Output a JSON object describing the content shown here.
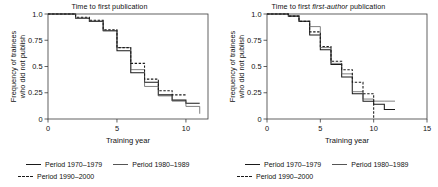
{
  "figure": {
    "background": "#ffffff",
    "width": 438,
    "height": 187
  },
  "panels": [
    {
      "id": "left",
      "title": "Time to first publication",
      "title_italic_part": "",
      "xlabel": "Training year",
      "ylabel_line1": "Frequency of trainees",
      "ylabel_line2": "who did not publish",
      "xticks": [
        "0",
        "5",
        "10"
      ],
      "yticks": [
        "1.0",
        "0.75",
        "0.5",
        "0.25",
        "0"
      ]
    },
    {
      "id": "right",
      "title_prefix": "Time to first ",
      "title_italic_part": "first-author",
      "title_suffix": " publication",
      "xlabel": "Training year",
      "ylabel_line1": "Frequency of trainees",
      "ylabel_line2": "who did not publish",
      "xticks": [
        "0",
        "5",
        "10",
        "15"
      ],
      "yticks": [
        "1.0",
        "0.75",
        "0.5",
        "0.25",
        "0"
      ]
    }
  ],
  "legend": {
    "entries": [
      {
        "label": "Period 1970–1979",
        "style": "solid-thick",
        "color": "#1a1a1a"
      },
      {
        "label": "Period 1980–1989",
        "style": "solid-thin",
        "color": "#555555"
      },
      {
        "label": "Period 1990–2000",
        "style": "dashed",
        "color": "#1a1a1a"
      }
    ]
  },
  "chart_data": [
    {
      "type": "line",
      "subtype": "kaplan-meier-step",
      "panel": "left",
      "title": "Time to first publication",
      "xlabel": "Training year",
      "ylabel": "Frequency of trainees who did not publish",
      "xlim": [
        0,
        11.6
      ],
      "ylim": [
        0,
        1.0
      ],
      "xticks": [
        0,
        5,
        10
      ],
      "yticks": [
        0,
        0.25,
        0.5,
        0.75,
        1.0
      ],
      "grid": false,
      "legend_position": "below",
      "series": [
        {
          "name": "Period 1970–1979",
          "style": "solid-thick",
          "color": "#1a1a1a",
          "x": [
            0,
            1,
            2,
            3,
            4,
            5,
            6,
            7,
            8,
            9,
            10,
            11
          ],
          "y": [
            1.0,
            1.0,
            0.96,
            0.93,
            0.84,
            0.65,
            0.44,
            0.35,
            0.23,
            0.18,
            0.15,
            0.15
          ]
        },
        {
          "name": "Period 1980–1989",
          "style": "solid-thin",
          "color": "#555555",
          "x": [
            0,
            1,
            2,
            3,
            4,
            5,
            6,
            7,
            8,
            9,
            10,
            11
          ],
          "y": [
            1.0,
            1.0,
            0.96,
            0.93,
            0.84,
            0.68,
            0.47,
            0.31,
            0.22,
            0.17,
            0.12,
            0.05
          ]
        },
        {
          "name": "Period 1990–2000",
          "style": "dashed",
          "color": "#1a1a1a",
          "x": [
            0,
            1,
            2,
            3,
            4,
            5,
            6,
            7,
            8,
            9,
            10
          ],
          "y": [
            1.0,
            1.0,
            0.97,
            0.94,
            0.85,
            0.68,
            0.53,
            0.38,
            0.27,
            0.23,
            0.23
          ]
        }
      ]
    },
    {
      "type": "line",
      "subtype": "kaplan-meier-step",
      "panel": "right",
      "title": "Time to first first-author publication",
      "xlabel": "Training year",
      "ylabel": "Frequency of trainees who did not publish",
      "xlim": [
        0,
        15
      ],
      "ylim": [
        0,
        1.0
      ],
      "xticks": [
        0,
        5,
        10,
        15
      ],
      "yticks": [
        0,
        0.25,
        0.5,
        0.75,
        1.0
      ],
      "grid": false,
      "legend_position": "below",
      "series": [
        {
          "name": "Period 1970–1979",
          "style": "solid-thick",
          "color": "#1a1a1a",
          "x": [
            0,
            1,
            2,
            3,
            4,
            5,
            6,
            7,
            8,
            9,
            10,
            11,
            12
          ],
          "y": [
            1.0,
            1.0,
            0.98,
            0.93,
            0.8,
            0.66,
            0.52,
            0.4,
            0.24,
            0.17,
            0.14,
            0.09,
            0.09
          ]
        },
        {
          "name": "Period 1980–1989",
          "style": "solid-thin",
          "color": "#555555",
          "x": [
            0,
            1,
            2,
            3,
            4,
            5,
            6,
            7,
            8,
            9,
            10,
            11,
            12
          ],
          "y": [
            1.0,
            1.0,
            0.98,
            0.93,
            0.88,
            0.68,
            0.53,
            0.43,
            0.26,
            0.19,
            0.17,
            0.17,
            0.17
          ]
        },
        {
          "name": "Period 1990–2000",
          "style": "dashed",
          "color": "#1a1a1a",
          "x": [
            0,
            1,
            2,
            3,
            4,
            5,
            6,
            7,
            8,
            9,
            10
          ],
          "y": [
            1.0,
            1.0,
            0.98,
            0.93,
            0.83,
            0.69,
            0.55,
            0.47,
            0.35,
            0.24,
            0.0
          ]
        }
      ]
    }
  ]
}
